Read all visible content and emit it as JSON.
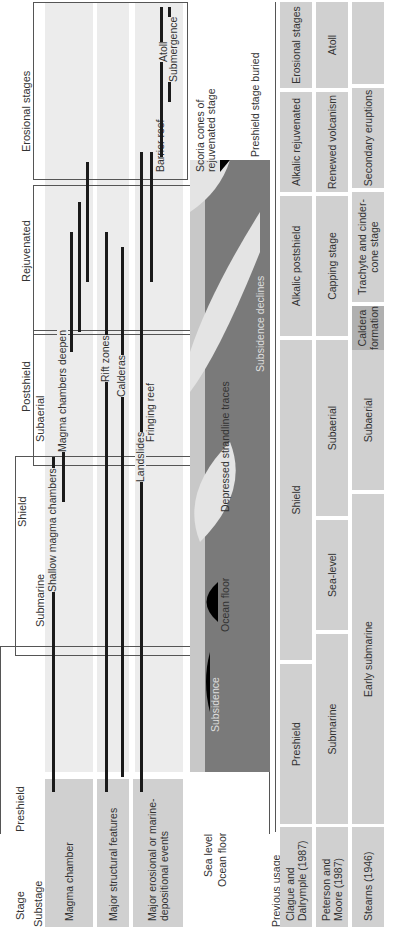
{
  "header": {
    "stage_label": "Stage",
    "substage_label": "Substage",
    "stages": [
      {
        "name": "Preshield"
      },
      {
        "name": "Shield",
        "substages": [
          "Submarine",
          "Subaerial"
        ]
      },
      {
        "name": "Postshield"
      },
      {
        "name": "Rejuvenated"
      },
      {
        "name": "Erosional stages"
      }
    ]
  },
  "rows": {
    "magma_chamber": "Magma chamber",
    "structural": "Major structural features",
    "erosional": "Major erosional or marine-depositional events",
    "sea_level": "Sea level",
    "ocean_floor": "Ocean floor"
  },
  "events": {
    "shallow_magma": "Shallow magma chambers",
    "magma_deepen": "Magma chambers deepen",
    "rift_zones": "Rift zones",
    "calderas": "Calderas",
    "landslides": "Landslides",
    "fringing_reef": "Fringing reef",
    "barrier_reef": "Barrier reef",
    "atoll": "Atoll",
    "submergence": "Submergence"
  },
  "cross_section": {
    "ocean_floor": "Ocean floor",
    "depressed_strandline": "Depressed strandline traces",
    "subsidence": "Subsidence",
    "subsidence_declines": "Subsidence declines",
    "scoria_cones": "Scoria cones of rejuvenated stage",
    "preshield_buried": "Preshield stage buried"
  },
  "previous_usage": {
    "title": "Previous usage",
    "sources": [
      {
        "name": "Clague and Dalrymple (1987)",
        "stages": [
          "Preshield",
          "Shield",
          "Alkalic postshield",
          "Alkalic rejuvenated",
          "Erosional stages"
        ]
      },
      {
        "name": "Peterson and Moore (1987)",
        "stages": [
          "Submarine",
          "Sea-level",
          "Subaerial",
          "Capping stage",
          "Renewed volcanism",
          "Atoll"
        ]
      },
      {
        "name": "Stearns (1946)",
        "stages": [
          "Early submarine",
          "Subaerial",
          "Caldera formation",
          "Trachyte and cinder-cone stage",
          "Secondary eruptions",
          ""
        ]
      }
    ]
  },
  "colors": {
    "band": "#ececec",
    "label_bg": "#d0d0d0",
    "ocean": "#7a7a7a",
    "water": "#c8c8c8",
    "volcano": "#e4e4e4",
    "bar": "#1a1a1a"
  }
}
